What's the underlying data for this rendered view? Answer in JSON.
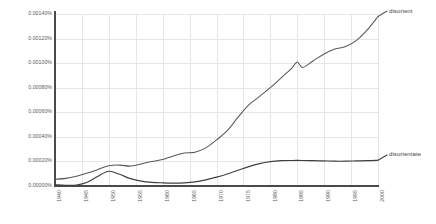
{
  "chart_data": {
    "type": "line",
    "title": "",
    "xlabel": "",
    "ylabel": "",
    "xlim": [
      1940,
      2000
    ],
    "ylim": [
      0.0,
      0.0014
    ],
    "grid": true,
    "legend_position": "inline-right",
    "y_tick_labels": [
      "0.00140%",
      "0.00120%",
      "0.00100%",
      "0.00080%",
      "0.00060%",
      "0.00040%",
      "0.00020%",
      "0.00000%"
    ],
    "y_tick_values": [
      0.0014,
      0.0012,
      0.001,
      0.0008,
      0.0006,
      0.0004,
      0.0002,
      0.0
    ],
    "x_tick_labels": [
      "1940",
      "1945",
      "1950",
      "1955",
      "1960",
      "1965",
      "1970",
      "1975",
      "1980",
      "1985",
      "1990",
      "1995",
      "2000"
    ],
    "x_tick_values": [
      1940,
      1945,
      1950,
      1955,
      1960,
      1965,
      1970,
      1975,
      1980,
      1985,
      1990,
      1995,
      2000
    ],
    "series": [
      {
        "name": "disorient",
        "color": "#55595c",
        "x": [
          1940,
          1942,
          1944,
          1946,
          1948,
          1950,
          1952,
          1954,
          1956,
          1958,
          1960,
          1962,
          1964,
          1966,
          1968,
          1970,
          1972,
          1974,
          1976,
          1978,
          1980,
          1982,
          1984,
          1985,
          1986,
          1988,
          1990,
          1992,
          1994,
          1996,
          1998,
          2000
        ],
        "values": [
          5.5e-05,
          6.2e-05,
          8e-05,
          0.000105,
          0.000135,
          0.000165,
          0.00017,
          0.000162,
          0.00018,
          0.0002,
          0.000215,
          0.000245,
          0.000268,
          0.000275,
          0.00031,
          0.000375,
          0.00045,
          0.00056,
          0.00066,
          0.00073,
          0.0008,
          0.00088,
          0.00096,
          0.00101,
          0.000965,
          0.00102,
          0.001075,
          0.001115,
          0.001135,
          0.001185,
          0.00127,
          0.00138
        ]
      },
      {
        "name": "disorientate",
        "color": "#3d4042",
        "x": [
          1940,
          1942,
          1944,
          1946,
          1948,
          1950,
          1952,
          1954,
          1956,
          1958,
          1960,
          1962,
          1964,
          1966,
          1968,
          1970,
          1972,
          1974,
          1976,
          1978,
          1980,
          1982,
          1984,
          1986,
          1988,
          1990,
          1992,
          1994,
          1996,
          1998,
          2000
        ],
        "values": [
          1e-05,
          6e-06,
          8e-06,
          3e-05,
          8e-05,
          0.00012,
          9.5e-05,
          6e-05,
          4e-05,
          3e-05,
          2.6e-05,
          2.4e-05,
          2.6e-05,
          3.4e-05,
          5e-05,
          7.2e-05,
          9.8e-05,
          0.000128,
          0.000158,
          0.000182,
          0.000198,
          0.000206,
          0.000208,
          0.000208,
          0.000206,
          0.000204,
          0.000202,
          0.000202,
          0.000204,
          0.000206,
          0.00021
        ]
      }
    ]
  }
}
